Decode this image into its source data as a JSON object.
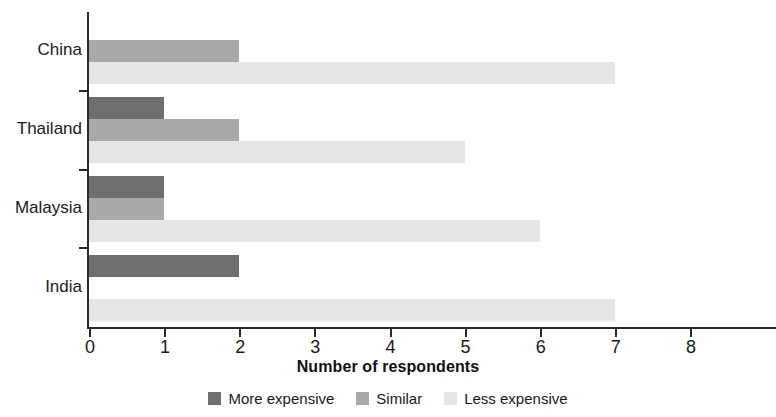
{
  "chart_data": {
    "type": "bar",
    "orientation": "horizontal",
    "grouped": true,
    "title": "",
    "xlabel": "Number of respondents",
    "ylabel": "",
    "xlim": [
      0,
      8
    ],
    "xticks": [
      "0",
      "1",
      "2",
      "3",
      "4",
      "5",
      "6",
      "7",
      "8"
    ],
    "grid": false,
    "legend_position": "bottom",
    "categories": [
      "China",
      "Thailand",
      "Malaysia",
      "India"
    ],
    "series": [
      {
        "name": "More expensive",
        "color": "#6e6e6e",
        "values": [
          0,
          1,
          1,
          2
        ]
      },
      {
        "name": "Similar",
        "color": "#a9a9a9",
        "values": [
          2,
          2,
          1,
          0
        ]
      },
      {
        "name": "Less expensive",
        "color": "#e6e6e6",
        "values": [
          7,
          5,
          6,
          7
        ]
      }
    ]
  },
  "axis": {
    "x_title": "Number of respondents"
  },
  "legend": {
    "items": [
      {
        "label": "More expensive",
        "color": "#6e6e6e"
      },
      {
        "label": "Similar",
        "color": "#a9a9a9"
      },
      {
        "label": "Less expensive",
        "color": "#e6e6e6"
      }
    ]
  }
}
